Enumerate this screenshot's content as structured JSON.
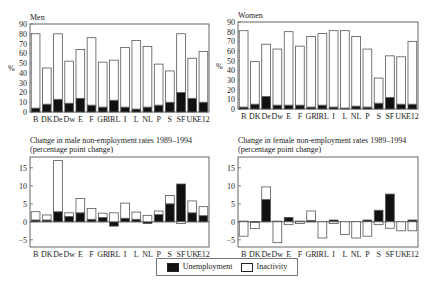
{
  "chart_data": [
    {
      "type": "bar",
      "stacked": true,
      "title": "Men",
      "ylabel": "%",
      "xlabel": "",
      "ylim": [
        0,
        90
      ],
      "yticks": [
        0,
        10,
        20,
        30,
        40,
        50,
        60,
        70,
        80,
        90
      ],
      "categories": [
        "B",
        "DK",
        "De",
        "Dw",
        "E",
        "F",
        "GR",
        "IRL",
        "I",
        "L",
        "NL",
        "P",
        "S",
        "SF",
        "UK",
        "E12"
      ],
      "series": [
        {
          "name": "Unemployment",
          "values": [
            4,
            8,
            13,
            9,
            14,
            7,
            5,
            12,
            5,
            3,
            5,
            7,
            10,
            20,
            14,
            10
          ]
        },
        {
          "name": "Inactivity",
          "values": [
            76,
            37,
            67,
            43,
            50,
            69,
            46,
            41,
            61,
            70,
            62,
            42,
            32,
            60,
            41,
            52
          ]
        }
      ],
      "totals": [
        80,
        45,
        80,
        52,
        64,
        76,
        51,
        53,
        66,
        73,
        67,
        49,
        42,
        80,
        55,
        62
      ],
      "grid": false
    },
    {
      "type": "bar",
      "stacked": true,
      "title": "Women",
      "ylabel": "%",
      "xlabel": "",
      "ylim": [
        0,
        90
      ],
      "yticks": [
        0,
        10,
        20,
        30,
        40,
        50,
        60,
        70,
        80,
        90
      ],
      "categories": [
        "B",
        "DK",
        "De",
        "Dw",
        "E",
        "F",
        "GR",
        "IRL",
        "I",
        "L",
        "NL",
        "P",
        "S",
        "SF",
        "UK",
        "E12"
      ],
      "series": [
        {
          "name": "Unemployment",
          "values": [
            2,
            5,
            13,
            4,
            4,
            4,
            2,
            4,
            2,
            1,
            3,
            2,
            6,
            12,
            5,
            5
          ]
        },
        {
          "name": "Inactivity",
          "values": [
            79,
            44,
            54,
            58,
            76,
            61,
            73,
            74,
            79,
            80,
            72,
            60,
            26,
            43,
            49,
            65
          ]
        }
      ],
      "totals": [
        81,
        49,
        67,
        62,
        80,
        65,
        75,
        78,
        81,
        81,
        75,
        62,
        32,
        55,
        54,
        70
      ],
      "grid": false
    },
    {
      "type": "bar",
      "stacked": true,
      "title": "Change in male non-employment rates 1989–1994",
      "subtitle": "(percentage point change)",
      "ylabel": "",
      "xlabel": "",
      "ylim": [
        -7,
        18
      ],
      "yticks": [
        -5,
        0,
        5,
        10,
        15
      ],
      "categories": [
        "B",
        "DK",
        "De",
        "Dw",
        "E",
        "F",
        "GR",
        "IRL",
        "I",
        "L",
        "NL",
        "P",
        "S",
        "SF",
        "UK",
        "E12"
      ],
      "series": [
        {
          "name": "Unemployment",
          "values": [
            0.5,
            0.5,
            2.8,
            1.5,
            2.5,
            0.7,
            1.2,
            -1.2,
            1.0,
            0.7,
            -0.5,
            2.0,
            5.0,
            10.5,
            2.5,
            1.7
          ]
        },
        {
          "name": "Inactivity",
          "values": [
            2.3,
            1.4,
            14.2,
            1.0,
            4.0,
            3.0,
            1.2,
            2.5,
            4.2,
            2.0,
            1.8,
            1.0,
            2.3,
            -0.5,
            3.3,
            2.5
          ]
        }
      ],
      "grid": false
    },
    {
      "type": "bar",
      "stacked": true,
      "title": "Change in female non-employment rates 1989–1994",
      "subtitle": "(percentage point change)",
      "ylabel": "",
      "xlabel": "",
      "ylim": [
        -7,
        18
      ],
      "yticks": [
        -5,
        0,
        5,
        10,
        15
      ],
      "categories": [
        "B",
        "DK",
        "De",
        "Dw",
        "E",
        "F",
        "GR",
        "IRL",
        "I",
        "L",
        "NL",
        "P",
        "S",
        "SF",
        "UK",
        "E12"
      ],
      "series": [
        {
          "name": "Unemployment",
          "values": [
            0.2,
            -0.2,
            6.2,
            0.2,
            1.2,
            0.2,
            0.4,
            0,
            0.5,
            0,
            0,
            0.5,
            3.2,
            7.7,
            0,
            0.5
          ]
        },
        {
          "name": "Inactivity",
          "values": [
            -4.0,
            -1.7,
            3.5,
            -5.8,
            -0.8,
            -0.5,
            2.6,
            -4.5,
            -0.5,
            -3.5,
            -4.5,
            -4.0,
            -0.8,
            -1.8,
            -2.5,
            -2.5
          ]
        }
      ],
      "grid": false
    }
  ],
  "legend": {
    "items": [
      {
        "label": "Unemployment",
        "color": "#111111"
      },
      {
        "label": "Inactivity",
        "color": "#ffffff"
      }
    ]
  },
  "colors": {
    "unemployment": "#111111",
    "inactivity": "#ffffff",
    "outline": "#555555"
  }
}
